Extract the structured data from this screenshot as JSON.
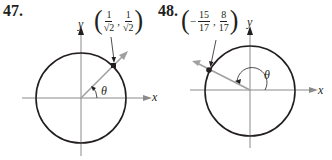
{
  "problems": [
    {
      "number": "47.",
      "point": {
        "sign": "",
        "x_num": "1",
        "x_den": "√2",
        "separator": ",",
        "y_num": "1",
        "y_den": "√2"
      },
      "angle_label": "θ",
      "x_axis_label": "x",
      "y_axis_label": "y",
      "angle_degrees": 45
    },
    {
      "number": "48.",
      "point": {
        "sign": "−",
        "x_num": "15",
        "x_den": "17",
        "separator": ",",
        "y_num": "8",
        "y_den": "17"
      },
      "angle_label": "θ",
      "x_axis_label": "x",
      "y_axis_label": "y",
      "angle_degrees": 152
    }
  ],
  "colors": {
    "ink": "#231f20",
    "axis": "#8a8a8a",
    "ray": "#9a9a9a"
  }
}
